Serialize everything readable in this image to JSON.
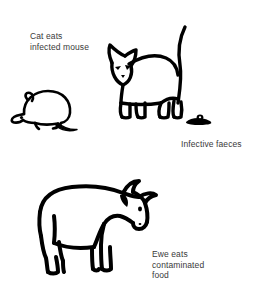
{
  "diagram": {
    "background_color": "#ffffff",
    "ink_color": "#000000",
    "text_color": "#3a3a3a",
    "width": 261,
    "height": 290
  },
  "labels": {
    "cat_eats": "Cat eats\ninfected mouse",
    "infective_faeces": "Infective faeces",
    "ewe_eats": "Ewe eats\ncontaminated\nfood"
  },
  "figures": {
    "mouse": "mouse-illustration",
    "cat": "cat-illustration",
    "faeces": "faeces-illustration",
    "cow": "ewe-cow-illustration"
  }
}
